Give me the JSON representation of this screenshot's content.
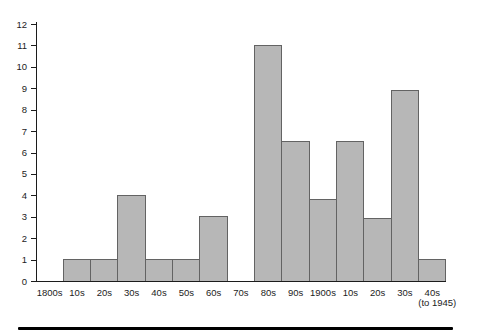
{
  "chart_data": {
    "type": "bar",
    "title": "",
    "xlabel": "",
    "ylabel": "",
    "categories": [
      "1800s",
      "10s",
      "20s",
      "30s",
      "40s",
      "50s",
      "60s",
      "70s",
      "80s",
      "90s",
      "1900s",
      "10s",
      "20s",
      "30s",
      "40s"
    ],
    "last_category_note": "(to 1945)",
    "values": [
      0,
      1,
      1,
      4,
      1,
      1,
      3,
      0,
      11,
      6.5,
      3.8,
      6.5,
      2.9,
      8.9,
      1
    ],
    "ylim": [
      0,
      12
    ],
    "yticks": [
      0,
      1,
      2,
      3,
      4,
      5,
      6,
      7,
      8,
      9,
      10,
      11,
      12
    ],
    "grid": false,
    "legend": "none",
    "bar_fill": "#b7b7b7",
    "bar_stroke": "#636363",
    "axis_color": "#1c1c1c",
    "text_color": "#1c1c1c"
  },
  "page": {
    "bottom_rule_color": "#000000"
  }
}
